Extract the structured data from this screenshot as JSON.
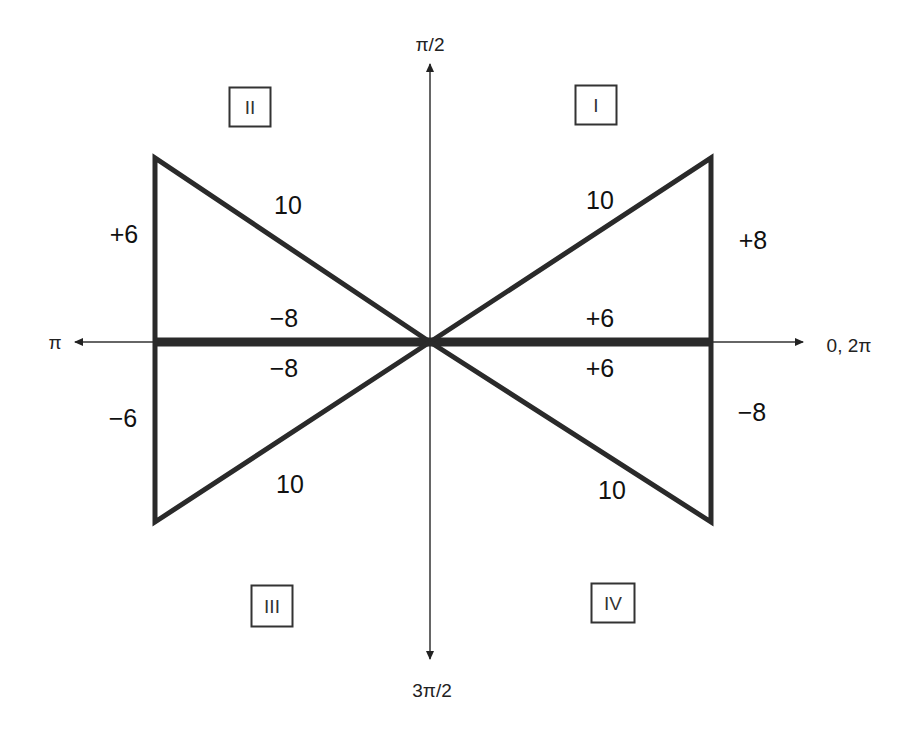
{
  "diagram": {
    "axes": {
      "top": "π/2",
      "bottom": "3π/2",
      "left": "π",
      "right": "0, 2π"
    },
    "quadrants": {
      "I": "I",
      "II": "II",
      "III": "III",
      "IV": "IV"
    },
    "triangles": {
      "quadrant_I": {
        "hypotenuse": "10",
        "vertical": "+8",
        "horizontal": "+6"
      },
      "quadrant_II": {
        "hypotenuse": "10",
        "vertical": "+6",
        "horizontal": "−8"
      },
      "quadrant_III": {
        "hypotenuse": "10",
        "vertical": "−6",
        "horizontal": "−8"
      },
      "quadrant_IV": {
        "hypotenuse": "10",
        "vertical": "−8",
        "horizontal": "+6"
      }
    },
    "colors": {
      "line": "#2a2a2a",
      "axis": "#333333",
      "background": "#ffffff"
    }
  }
}
